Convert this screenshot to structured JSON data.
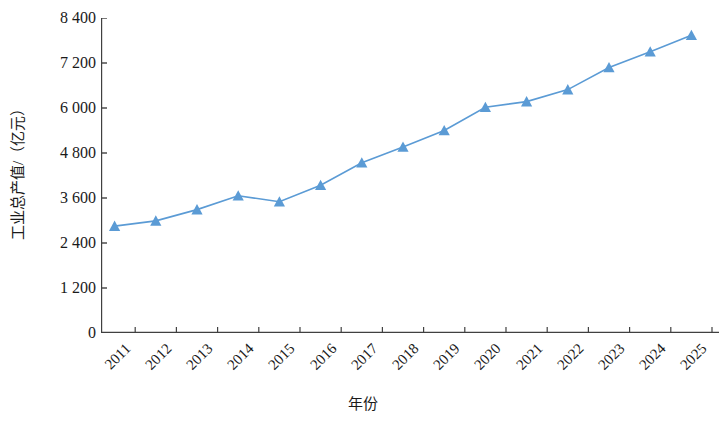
{
  "chart_data": {
    "type": "line",
    "title": "",
    "xlabel": "年份",
    "ylabel": "工业总产值/（亿元）",
    "categories": [
      "2011",
      "2012",
      "2013",
      "2014",
      "2015",
      "2016",
      "2017",
      "2018",
      "2019",
      "2020",
      "2021",
      "2022",
      "2023",
      "2024",
      "2025"
    ],
    "series": [
      {
        "name": "工业总产值",
        "values": [
          2850,
          2990,
          3290,
          3660,
          3500,
          3940,
          4540,
          4960,
          5400,
          6020,
          6170,
          6490,
          7080,
          7500,
          7940
        ],
        "color": "#5B9BD5",
        "marker": "triangle"
      }
    ],
    "ylim": [
      0,
      8400
    ],
    "yticks": [
      0,
      1200,
      2400,
      3600,
      4800,
      6000,
      7200,
      8400
    ],
    "ytick_labels": [
      "0",
      "1 200",
      "2 400",
      "3 600",
      "4 800",
      "6 000",
      "7 200",
      "8 400"
    ],
    "grid": false,
    "legend": "none",
    "axis_color": "#404040",
    "line_color": "#5B9BD5"
  }
}
